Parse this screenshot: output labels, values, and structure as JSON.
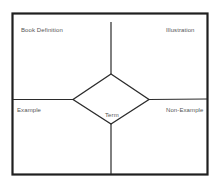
{
  "diagram": {
    "type": "frayer-model",
    "colors": {
      "line": "#2b2b2b",
      "text": "#555555",
      "background": "#ffffff"
    },
    "quadrants": {
      "top_left": "Book Definition",
      "top_right": "Illustration",
      "bottom_left": "Example",
      "bottom_right": "Non-Example"
    },
    "center": {
      "label": "Term"
    }
  }
}
